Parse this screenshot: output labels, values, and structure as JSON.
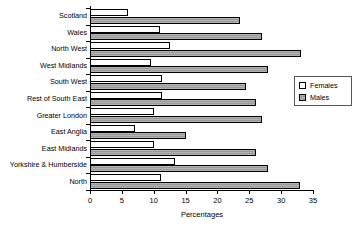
{
  "chart_data": {
    "type": "bar",
    "orientation": "horizontal",
    "title": "",
    "xlabel": "Percentages",
    "ylabel": "",
    "xlim": [
      0,
      35
    ],
    "xticks": [
      0,
      5,
      10,
      15,
      20,
      25,
      30,
      35
    ],
    "grid": false,
    "legend_position": "right",
    "categories": [
      "Scotland",
      "Wales",
      "North West",
      "West Midlands",
      "South West",
      "Rest of South East",
      "Greater London",
      "East Anglia",
      "East Midlands",
      "Yorkshire & Humberside",
      "North"
    ],
    "series": [
      {
        "name": "Females",
        "color": "#ffffff",
        "values": [
          6.0,
          11.0,
          12.5,
          9.5,
          11.3,
          11.3,
          10.0,
          7.0,
          10.0,
          13.3,
          11.1
        ]
      },
      {
        "name": "Males",
        "color": "#a8a8a8",
        "values": [
          23.5,
          27.0,
          33.1,
          28.0,
          24.5,
          26.0,
          27.0,
          15.0,
          26.0,
          28.0,
          33.0
        ]
      }
    ]
  },
  "legend": {
    "entries": [
      {
        "label": "Females",
        "swatch": "females"
      },
      {
        "label": "Males",
        "swatch": "males"
      }
    ]
  }
}
